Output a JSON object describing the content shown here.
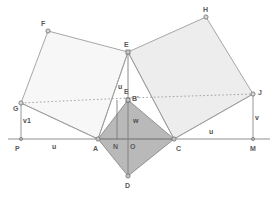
{
  "figure": {
    "width": 275,
    "height": 201,
    "background": "#ffffff"
  },
  "colors": {
    "stroke": "#9a9a9a",
    "stroke_dark": "#7d7d7d",
    "baseline": "#8f8f8f",
    "square_left_fill": "#f7f7f7",
    "square_right_fill": "#ededed",
    "kite_fill": "#b9b9b9",
    "dotted": "#9a9a9a",
    "point_fill": "#d8d8d8",
    "point_stroke": "#6e6e6e",
    "label_text": "#5a5a5a"
  },
  "points": [
    {
      "id": "F",
      "label": "F",
      "x": 48,
      "y": 31,
      "lx": 41,
      "ly": 20
    },
    {
      "id": "H",
      "label": "H",
      "x": 206,
      "y": 17,
      "lx": 203,
      "ly": 6
    },
    {
      "id": "E",
      "label": "E",
      "x": 128,
      "y": 52,
      "lx": 124,
      "ly": 41
    },
    {
      "id": "G",
      "label": "G",
      "x": 21,
      "y": 103,
      "lx": 13,
      "ly": 105
    },
    {
      "id": "J",
      "label": "J",
      "x": 253,
      "y": 94,
      "lx": 258,
      "ly": 89
    },
    {
      "id": "Bp",
      "label": "B'",
      "x": 128,
      "y": 100,
      "lx": 132,
      "ly": 95
    },
    {
      "id": "Eb",
      "label": "E",
      "x": 128,
      "y": 100,
      "lx": 124,
      "ly": 88
    },
    {
      "id": "A",
      "label": "A",
      "x": 98,
      "y": 139,
      "lx": 93,
      "ly": 145
    },
    {
      "id": "C",
      "label": "C",
      "x": 174,
      "y": 139,
      "lx": 176,
      "ly": 145
    },
    {
      "id": "D",
      "label": "D",
      "x": 128,
      "y": 176,
      "lx": 125,
      "ly": 182
    },
    {
      "id": "P",
      "label": "P",
      "x": 21,
      "y": 139,
      "lx": 15,
      "ly": 145
    },
    {
      "id": "M",
      "label": "M",
      "x": 253,
      "y": 139,
      "lx": 250,
      "ly": 145
    },
    {
      "id": "N",
      "label": "N",
      "x": 117,
      "y": 139,
      "lx": 113,
      "ly": 143
    },
    {
      "id": "O",
      "label": "O",
      "x": 134,
      "y": 139,
      "lx": 130,
      "ly": 143
    }
  ],
  "segment_labels": [
    {
      "id": "u-left",
      "label": "u",
      "lx": 52,
      "ly": 143
    },
    {
      "id": "u-right",
      "label": "u",
      "lx": 209,
      "ly": 128
    },
    {
      "id": "u-vert",
      "label": "u",
      "lx": 118,
      "ly": 83
    },
    {
      "id": "v1",
      "label": "v1",
      "lx": 23,
      "ly": 117
    },
    {
      "id": "v-right",
      "label": "v",
      "lx": 255,
      "ly": 114
    },
    {
      "id": "w",
      "label": "w",
      "lx": 133,
      "ly": 117
    }
  ],
  "shapes": {
    "square_left": {
      "name": "square-AFEG",
      "vertices": "48,31 128,52 98,139 21,103"
    },
    "square_right": {
      "name": "square-EHJC",
      "vertices": "128,52 206,17 253,94 174,139"
    },
    "kite": {
      "name": "kite-ABPCD",
      "vertices": "98,139 128,100 174,139 128,176"
    }
  },
  "lines": {
    "baseline": {
      "name": "baseline-PM",
      "x1": 8,
      "y1": 139,
      "x2": 270,
      "y2": 139
    },
    "dotted_GJ": {
      "name": "dotted-G-to-J",
      "points": "21,103 128,98 253,94"
    },
    "vertical_E_D": {
      "name": "vertical-E-to-D",
      "x1": 128,
      "y1": 52,
      "x2": 128,
      "y2": 176
    },
    "vertical_N": {
      "name": "vertical-N",
      "x1": 117,
      "y1": 100,
      "x2": 117,
      "y2": 139
    },
    "vertical_G_P": {
      "name": "vertical-G-to-P",
      "x1": 21,
      "y1": 103,
      "x2": 21,
      "y2": 139
    },
    "vertical_J_M": {
      "name": "vertical-J-to-M",
      "x1": 253,
      "y1": 94,
      "x2": 253,
      "y2": 139
    },
    "diag_A_Bp": {
      "name": "diagonal-A-to-Bprime",
      "x1": 98,
      "y1": 139,
      "x2": 128,
      "y2": 100
    },
    "diag_C_Bp": {
      "name": "diagonal-C-to-Bprime",
      "x1": 174,
      "y1": 139,
      "x2": 128,
      "y2": 100
    },
    "chord_A_C": {
      "name": "chord-A-to-C",
      "x1": 98,
      "y1": 139,
      "x2": 174,
      "y2": 139
    },
    "ray_G_A": {
      "name": "ray-G-to-A",
      "x1": 21,
      "y1": 103,
      "x2": 98,
      "y2": 139
    },
    "ray_J_C": {
      "name": "ray-J-to-C",
      "x1": 253,
      "y1": 94,
      "x2": 174,
      "y2": 139
    }
  }
}
